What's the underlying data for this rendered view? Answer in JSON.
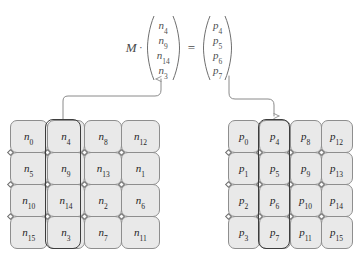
{
  "equation": {
    "matrix_label": "M",
    "dot_operator": "·",
    "equals": "=",
    "input_vector": {
      "name": "input-column-vector",
      "entries": [
        {
          "base": "n",
          "sub": "4"
        },
        {
          "base": "n",
          "sub": "9"
        },
        {
          "base": "n",
          "sub": "14"
        },
        {
          "base": "n",
          "sub": "3"
        }
      ]
    },
    "output_vector": {
      "name": "output-column-vector",
      "entries": [
        {
          "base": "p",
          "sub": "4"
        },
        {
          "base": "p",
          "sub": "5"
        },
        {
          "base": "p",
          "sub": "6"
        },
        {
          "base": "p",
          "sub": "7"
        }
      ]
    }
  },
  "grids": {
    "left": {
      "name": "source-grid-n",
      "highlighted_column_index": 1,
      "rows": [
        [
          {
            "base": "n",
            "sub": "0"
          },
          {
            "base": "n",
            "sub": "4"
          },
          {
            "base": "n",
            "sub": "8"
          },
          {
            "base": "n",
            "sub": "12"
          }
        ],
        [
          {
            "base": "n",
            "sub": "5"
          },
          {
            "base": "n",
            "sub": "9"
          },
          {
            "base": "n",
            "sub": "13"
          },
          {
            "base": "n",
            "sub": "1"
          }
        ],
        [
          {
            "base": "n",
            "sub": "10"
          },
          {
            "base": "n",
            "sub": "14"
          },
          {
            "base": "n",
            "sub": "2"
          },
          {
            "base": "n",
            "sub": "6"
          }
        ],
        [
          {
            "base": "n",
            "sub": "15"
          },
          {
            "base": "n",
            "sub": "3"
          },
          {
            "base": "n",
            "sub": "7"
          },
          {
            "base": "n",
            "sub": "11"
          }
        ]
      ]
    },
    "right": {
      "name": "result-grid-p",
      "highlighted_column_index": 1,
      "rows": [
        [
          {
            "base": "p",
            "sub": "0"
          },
          {
            "base": "p",
            "sub": "4"
          },
          {
            "base": "p",
            "sub": "8"
          },
          {
            "base": "p",
            "sub": "12"
          }
        ],
        [
          {
            "base": "p",
            "sub": "1"
          },
          {
            "base": "p",
            "sub": "5"
          },
          {
            "base": "p",
            "sub": "9"
          },
          {
            "base": "p",
            "sub": "13"
          }
        ],
        [
          {
            "base": "p",
            "sub": "2"
          },
          {
            "base": "p",
            "sub": "6"
          },
          {
            "base": "p",
            "sub": "10"
          },
          {
            "base": "p",
            "sub": "14"
          }
        ],
        [
          {
            "base": "p",
            "sub": "3"
          },
          {
            "base": "p",
            "sub": "7"
          },
          {
            "base": "p",
            "sub": "11"
          },
          {
            "base": "p",
            "sub": "15"
          }
        ]
      ]
    }
  },
  "connectors": [
    {
      "name": "left-grid-to-input-vector",
      "direction": "grid-to-vector"
    },
    {
      "name": "output-vector-to-right-grid",
      "direction": "vector-to-grid"
    }
  ],
  "colors": {
    "cell_fill": "#e9e9e9",
    "cell_stroke": "#8e8e8e",
    "highlight_stroke": "#3d3d3d",
    "text": "#1f1f1f",
    "equation_text": "#4f4f4f",
    "connector_stroke": "#8a8a8a",
    "background": "#ffffff"
  }
}
